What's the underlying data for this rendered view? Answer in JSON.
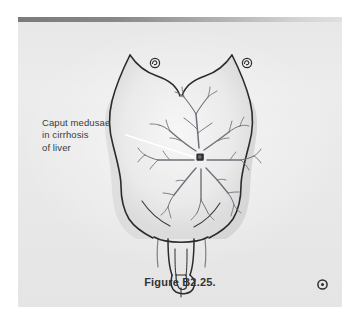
{
  "figure": {
    "caption": "Figure B2.25.",
    "annotation": {
      "line1": "Caput medusae",
      "line2": "in cirrhosis",
      "line3": "of liver"
    },
    "corner_marker_icon": "circle-dot-icon",
    "leader_line_color": "#ffffff"
  },
  "illustration": {
    "body_outline_icon": "male-torso-outline",
    "umbilicus_icon": "umbilicus-marker",
    "left_nipple_icon": "nipple-icon",
    "right_nipple_icon": "nipple-icon",
    "veins_icon": "dilated-paraumbilical-veins",
    "genitalia_icon": "penis-scrotum-outline"
  },
  "colors": {
    "page_background": "#ffffff",
    "paper": "#ececec",
    "header_band_dark": "#7c7c7c",
    "header_band_light": "#e4e4e4",
    "ink": "#2b2b2d",
    "label_text": "#3a3a3c",
    "caption_text": "#333335",
    "skin_shadow": "#cfcfcf",
    "vein": "#6b6b74"
  }
}
